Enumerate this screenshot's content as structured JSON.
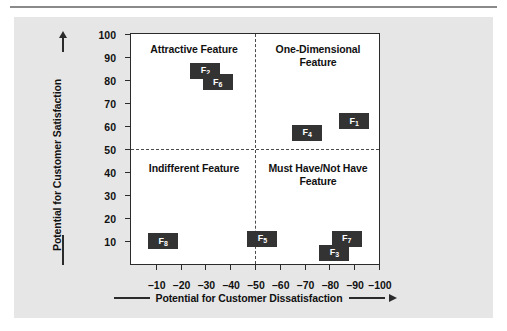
{
  "chart_data": {
    "type": "scatter",
    "title": "",
    "xlabel": "Potential for Customer Dissatisfaction",
    "ylabel": "Potential for Customer Satisfaction",
    "xlim": [
      0,
      -100
    ],
    "ylim": [
      0,
      100
    ],
    "grid": false,
    "legend": "none",
    "xticks": [
      "-10",
      "-20",
      "-30",
      "-40",
      "-50",
      "-60",
      "-70",
      "-80",
      "-90",
      "-100"
    ],
    "xtick_values": [
      -10,
      -20,
      -30,
      -40,
      -50,
      -60,
      -70,
      -80,
      -90,
      -100
    ],
    "yticks": [
      "10",
      "20",
      "30",
      "40",
      "50",
      "60",
      "70",
      "80",
      "90",
      "100"
    ],
    "ytick_values": [
      10,
      20,
      30,
      40,
      50,
      60,
      70,
      80,
      90,
      100
    ],
    "dividers": {
      "x": -50,
      "y": 50
    },
    "points": [
      {
        "label": "F",
        "sub": "2",
        "x": -30,
        "y": 84
      },
      {
        "label": "F",
        "sub": "6",
        "x": -35,
        "y": 79
      },
      {
        "label": "F",
        "sub": "1",
        "x": -90,
        "y": 62
      },
      {
        "label": "F",
        "sub": "4",
        "x": -71,
        "y": 57
      },
      {
        "label": "F",
        "sub": "8",
        "x": -13,
        "y": 10
      },
      {
        "label": "F",
        "sub": "5",
        "x": -53,
        "y": 11
      },
      {
        "label": "F",
        "sub": "7",
        "x": -87,
        "y": 11
      },
      {
        "label": "F",
        "sub": "3",
        "x": -82,
        "y": 5
      }
    ],
    "quadrants": [
      {
        "name": "attractive",
        "label": "Attractive Feature"
      },
      {
        "name": "one-dimensional",
        "label": "One-Dimensional Feature"
      },
      {
        "name": "indifferent",
        "label": "Indifferent Feature"
      },
      {
        "name": "must-have",
        "label": "Must Have/Not Have Feature"
      }
    ],
    "colors": {
      "marker": "#333333",
      "marker_text": "#ffffff",
      "axis": "#2b2b2b",
      "panel": "#e6e6e6",
      "plot_background": "#ffffff",
      "text": "#111111"
    }
  }
}
